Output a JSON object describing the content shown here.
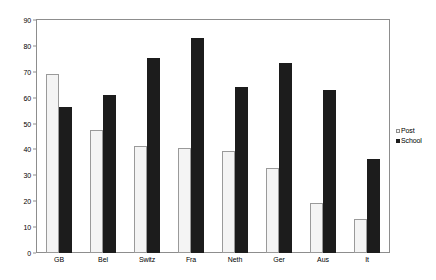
{
  "chart_data": {
    "type": "bar",
    "title": "",
    "xlabel": "",
    "ylabel": "",
    "ylim": [
      0,
      90
    ],
    "ytick_step": 10,
    "yticks": [
      0,
      10,
      20,
      30,
      40,
      50,
      60,
      70,
      80,
      90
    ],
    "ytick_labels": [
      "0",
      "10",
      "20",
      "30",
      "40",
      "50",
      "60",
      "70",
      "80",
      "90"
    ],
    "grid": false,
    "legend_position": "right",
    "categories": [
      "GB",
      "Bel",
      "Switz",
      "Fra",
      "Neth",
      "Ger",
      "Aus",
      "It"
    ],
    "series": [
      {
        "name": "Post",
        "color": "#f4f4f4",
        "edge_color": "#9a9a9a",
        "values": [
          69,
          47.5,
          41.5,
          40.5,
          39.5,
          33,
          19.5,
          13
        ]
      },
      {
        "name": "School",
        "color": "#1c1c1c",
        "edge_color": "#1c1c1c",
        "values": [
          56.5,
          61,
          75.5,
          83,
          64,
          73.5,
          63,
          36.5
        ]
      }
    ]
  },
  "legend": {
    "items": [
      {
        "label": "Post",
        "marker": "square-light-swatch"
      },
      {
        "label": "School",
        "marker": "square-dark-swatch"
      }
    ]
  },
  "colors": {
    "axis": "#8d8d8d",
    "text": "#000000",
    "background": "#ffffff",
    "post_fill": "#f4f4f4",
    "school_fill": "#1c1c1c"
  }
}
